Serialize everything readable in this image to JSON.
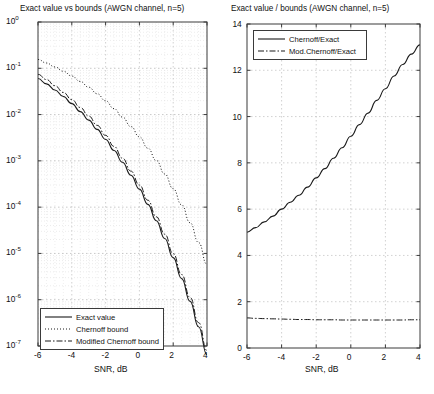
{
  "figure": {
    "background": "#ffffff",
    "axis_color": "#3a3a3a",
    "grid_color": "#bdbdbd",
    "line_color": "#1a1a1a"
  },
  "panels": [
    {
      "id": "left",
      "title": "Exact value vs bounds (AWGN channel, n=5)",
      "xlabel": "SNR, dB",
      "ylabel": "",
      "xticks": [
        -6,
        -4,
        -2,
        0,
        2,
        4
      ],
      "xticklabels": [
        "-6",
        "-4",
        "-2",
        "0",
        "2",
        "4"
      ],
      "yticklabels": [
        "10",
        "10",
        "10",
        "10",
        "10",
        "10",
        "10",
        "10"
      ],
      "yexponents": [
        "0",
        "-1",
        "-2",
        "-3",
        "-4",
        "-5",
        "-6",
        "-7"
      ],
      "legend": [
        {
          "label": "Exact value",
          "style": "solid"
        },
        {
          "label": "Chernoff bound",
          "style": "dotted"
        },
        {
          "label": "Modified Chernoff bound",
          "style": "dashdot"
        }
      ]
    },
    {
      "id": "right",
      "title": "Exact value / bounds (AWGN channel, n=5)",
      "xlabel": "SNR, dB",
      "ylabel": "",
      "xticks": [
        -6,
        -4,
        -2,
        0,
        2,
        4
      ],
      "xticklabels": [
        "-6",
        "-4",
        "-2",
        "0",
        "2",
        "4"
      ],
      "yticks": [
        0,
        2,
        4,
        6,
        8,
        10,
        12,
        14
      ],
      "yticklabels": [
        "0",
        "2",
        "4",
        "6",
        "8",
        "10",
        "12",
        "14"
      ],
      "legend": [
        {
          "label": "Chernoff/Exact",
          "style": "solid"
        },
        {
          "label": "Mod.Chernoff/Exact",
          "style": "dashdot"
        }
      ]
    }
  ],
  "chart_data": [
    {
      "type": "line",
      "id": "left-plot",
      "title": "Exact value vs bounds (AWGN channel, n=5)",
      "xlabel": "SNR, dB",
      "ylabel": "",
      "yscale": "log",
      "xscale": "linear",
      "xlim": [
        -6,
        4
      ],
      "ylim": [
        1e-07,
        1
      ],
      "grid": true,
      "legend_position": "lower-left",
      "x": [
        -6,
        -5.5,
        -5,
        -4.5,
        -4,
        -3.5,
        -3,
        -2.5,
        -2,
        -1.5,
        -1,
        -0.5,
        0,
        0.5,
        1,
        1.5,
        2,
        2.5,
        3,
        3.5,
        4
      ],
      "series": [
        {
          "name": "Exact value",
          "style": "solid",
          "values": [
            0.06,
            0.046,
            0.034,
            0.0245,
            0.0172,
            0.0116,
            0.0076,
            0.0048,
            0.0029,
            0.00168,
            0.00093,
            0.00049,
            0.000245,
            0.000115,
            5.1e-05,
            2.1e-05,
            8.1e-06,
            2.85e-06,
            9.2e-07,
            2.6e-07,
            6.5e-08
          ]
        },
        {
          "name": "Chernoff bound",
          "style": "dotted",
          "values": [
            0.155,
            0.13,
            0.107,
            0.086,
            0.068,
            0.052,
            0.039,
            0.0282,
            0.0198,
            0.0134,
            0.0088,
            0.0055,
            0.0033,
            0.00188,
            0.00102,
            0.00052,
            0.00025,
            0.000112,
            4.6e-05,
            1.72e-05,
            5.8e-06
          ]
        },
        {
          "name": "Modified Chernoff bound",
          "style": "dashdot",
          "values": [
            0.074,
            0.057,
            0.042,
            0.03,
            0.021,
            0.0142,
            0.0093,
            0.00585,
            0.00355,
            0.00205,
            0.00114,
            0.0006,
            0.0003,
            0.000141,
            6.2e-05,
            2.6e-05,
            9.9e-06,
            3.5e-06,
            1.12e-06,
            3.2e-07,
            8e-08
          ]
        }
      ]
    },
    {
      "type": "line",
      "id": "right-plot",
      "title": "Exact value / bounds (AWGN channel, n=5)",
      "xlabel": "SNR, dB",
      "ylabel": "",
      "yscale": "linear",
      "xscale": "linear",
      "xlim": [
        -6,
        4
      ],
      "ylim": [
        0,
        14
      ],
      "grid": true,
      "legend_position": "upper-left",
      "x": [
        -6,
        -5.5,
        -5,
        -4.5,
        -4,
        -3.5,
        -3,
        -2.5,
        -2,
        -1.5,
        -1,
        -0.5,
        0,
        0.5,
        1,
        1.5,
        2,
        2.5,
        3,
        3.5,
        4
      ],
      "series": [
        {
          "name": "Chernoff/Exact",
          "style": "solid",
          "values": [
            5.0,
            5.2,
            5.45,
            5.7,
            6.0,
            6.3,
            6.6,
            6.95,
            7.35,
            7.75,
            8.2,
            8.65,
            9.15,
            9.65,
            10.15,
            10.7,
            11.2,
            11.75,
            12.25,
            12.7,
            13.1
          ]
        },
        {
          "name": "Mod.Chernoff/Exact",
          "style": "dashdot",
          "values": [
            1.3,
            1.28,
            1.27,
            1.26,
            1.25,
            1.24,
            1.23,
            1.23,
            1.22,
            1.22,
            1.22,
            1.21,
            1.21,
            1.21,
            1.21,
            1.21,
            1.21,
            1.21,
            1.21,
            1.22,
            1.22
          ]
        }
      ]
    }
  ]
}
